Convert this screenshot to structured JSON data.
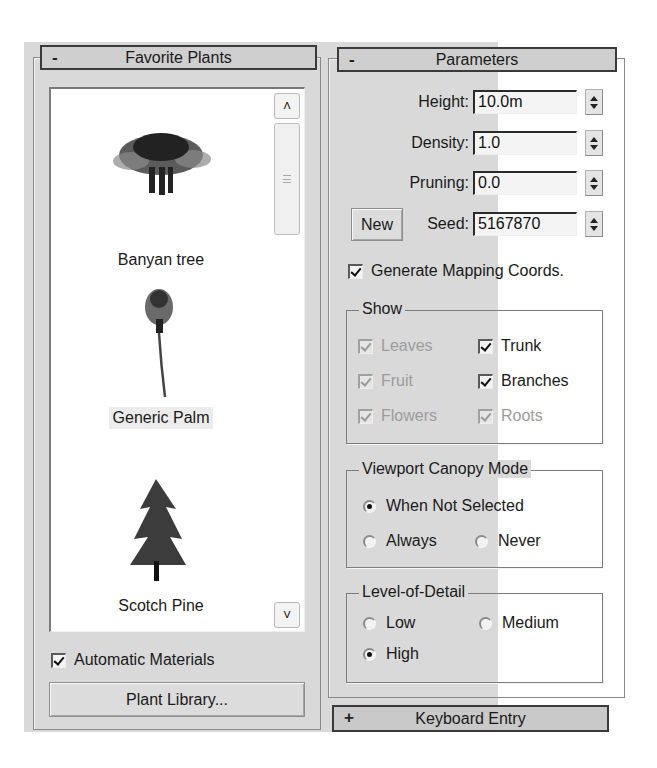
{
  "favorite_plants": {
    "title": "Favorite Plants",
    "collapse_sign": "-",
    "plants": [
      {
        "name": "Banyan tree",
        "icon": "banyan-tree-icon",
        "selected": false
      },
      {
        "name": "Generic Palm",
        "icon": "palm-tree-icon",
        "selected": true
      },
      {
        "name": "Scotch Pine",
        "icon": "pine-tree-icon",
        "selected": false
      }
    ],
    "scroll_up": "^",
    "scroll_down": "v",
    "automatic_materials": {
      "label": "Automatic Materials",
      "checked": true
    },
    "plant_library_button": "Plant Library..."
  },
  "parameters": {
    "title": "Parameters",
    "collapse_sign": "-",
    "height": {
      "label": "Height:",
      "value": "10.0m"
    },
    "density": {
      "label": "Density:",
      "value": "1.0"
    },
    "pruning": {
      "label": "Pruning:",
      "value": "0.0"
    },
    "seed": {
      "label": "Seed:",
      "value": "5167870"
    },
    "new_button": "New",
    "generate_mapping": {
      "label": "Generate Mapping Coords.",
      "checked": true
    },
    "show": {
      "title": "Show",
      "items": [
        {
          "label": "Leaves",
          "checked": true,
          "enabled": false
        },
        {
          "label": "Trunk",
          "checked": true,
          "enabled": true
        },
        {
          "label": "Fruit",
          "checked": true,
          "enabled": false
        },
        {
          "label": "Branches",
          "checked": true,
          "enabled": true
        },
        {
          "label": "Flowers",
          "checked": true,
          "enabled": false
        },
        {
          "label": "Roots",
          "checked": true,
          "enabled": false
        }
      ]
    },
    "viewport_canopy_mode": {
      "title": "Viewport Canopy Mode",
      "options": [
        "When Not Selected",
        "Always",
        "Never"
      ],
      "selected": "When Not Selected"
    },
    "level_of_detail": {
      "title": "Level-of-Detail",
      "options": [
        "Low",
        "Medium",
        "High"
      ],
      "selected": "High"
    }
  },
  "keyboard_entry": {
    "title": "Keyboard Entry",
    "expand_sign": "+"
  }
}
